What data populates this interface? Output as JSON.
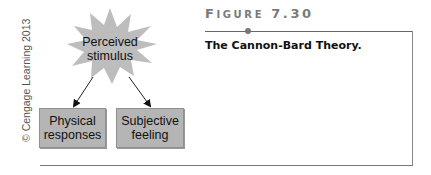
{
  "figure": {
    "label_prefix": "F",
    "label_rest": "IGURE",
    "number": "7.30",
    "title": "The Cannon-Bard Theory."
  },
  "copyright": "© Cengage Learning 2013",
  "diagram": {
    "source_node": {
      "line1": "Perceived",
      "line2": "stimulus",
      "shape": "starburst",
      "color": "#bdbdbd"
    },
    "target_nodes": [
      {
        "line1": "Physical",
        "line2": "responses",
        "shape": "rectangle",
        "color": "#b5b5b5"
      },
      {
        "line1": "Subjective",
        "line2": "feeling",
        "shape": "rectangle",
        "color": "#b5b5b5"
      }
    ],
    "edges": [
      {
        "from": "Perceived stimulus",
        "to": "Physical responses"
      },
      {
        "from": "Perceived stimulus",
        "to": "Subjective feeling"
      }
    ]
  }
}
